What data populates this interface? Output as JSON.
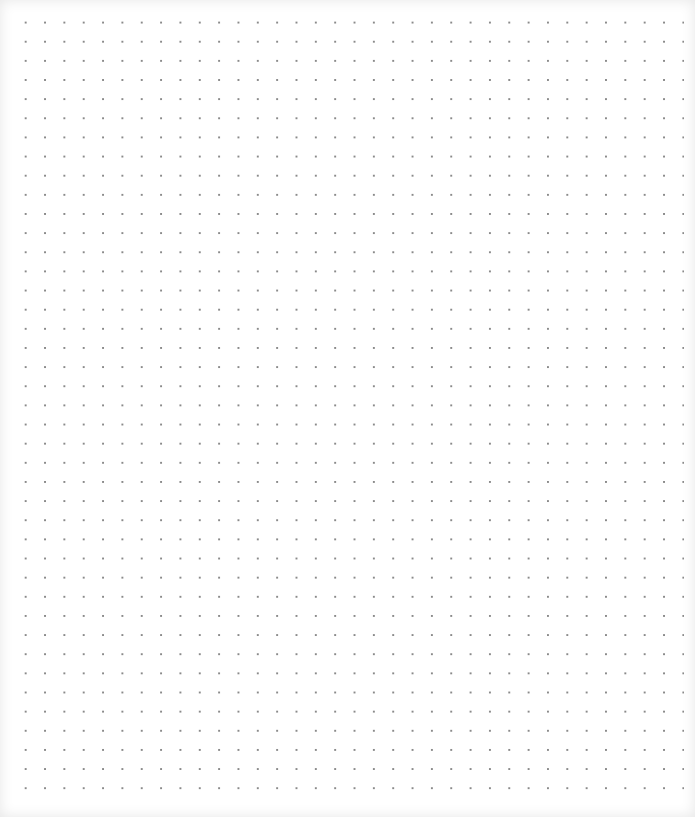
{
  "page": {
    "type": "dotted-grid-paper",
    "dot_spacing_px": 19.3,
    "dot_color": "#8a8a8a",
    "background_color": "#ffffff"
  }
}
